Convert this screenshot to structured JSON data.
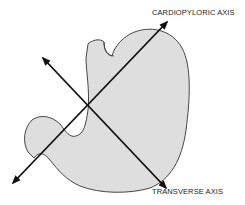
{
  "diagram": {
    "labels": {
      "cardiopyloric": "CARDIOPYLORIC AXIS",
      "transverse": "TRANSVERSE AXIS"
    },
    "colors": {
      "organ_fill": "#dedede",
      "outline": "#333333",
      "arrow": "#111111",
      "text": "#222222"
    }
  }
}
